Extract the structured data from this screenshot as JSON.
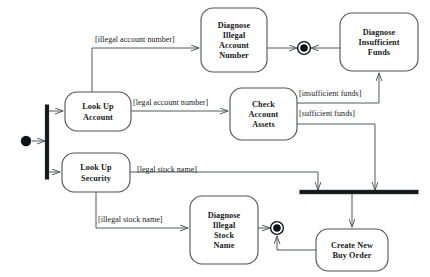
{
  "diagram": {
    "kind": "uml-activity-diagram",
    "title": "",
    "colors": {
      "background": "#ffffff",
      "node_stroke": "#4e5357",
      "edge_stroke": "#555a5e",
      "control_node_fill": "#101214",
      "text": "#17191b"
    },
    "nodes": [
      {
        "id": "initial",
        "type": "initial-node",
        "label": "",
        "cx": 26,
        "cy": 141,
        "r": 5.2
      },
      {
        "id": "fork-main",
        "type": "fork-bar-vertical",
        "label": "",
        "x": 47,
        "y1": 105,
        "y2": 179,
        "thickness": 3.2
      },
      {
        "id": "look-up-account",
        "type": "activity",
        "label": "Look Up\nAccount",
        "lines": [
          "Look Up",
          "Account"
        ],
        "x": 65,
        "y": 92,
        "w": 66,
        "h": 39,
        "rx": 12
      },
      {
        "id": "look-up-security",
        "type": "activity",
        "label": "Look Up\nSecurity",
        "lines": [
          "Look Up",
          "Security"
        ],
        "x": 62,
        "y": 153,
        "w": 68,
        "h": 39,
        "rx": 12
      },
      {
        "id": "diagnose-illegal-account-number",
        "type": "activity",
        "label": "Diagnose Illegal Account Number",
        "lines": [
          "Diagnose",
          "Illegal",
          "Account",
          "Number"
        ],
        "x": 201,
        "y": 8,
        "w": 66,
        "h": 64,
        "rx": 12
      },
      {
        "id": "check-account-assets",
        "type": "activity",
        "label": "Check Account Assets",
        "lines": [
          "Check",
          "Account",
          "Assets"
        ],
        "x": 230,
        "y": 88,
        "w": 67,
        "h": 52,
        "rx": 12
      },
      {
        "id": "diagnose-insufficient-funds",
        "type": "activity",
        "label": "Diagnose Insufficient Funds",
        "lines": [
          "Diagnose",
          "Insufficient",
          "Funds"
        ],
        "x": 340,
        "y": 13,
        "w": 78,
        "h": 58,
        "rx": 12
      },
      {
        "id": "diagnose-illegal-stock-name",
        "type": "activity",
        "label": "Diagnose Illegal Stock Name",
        "lines": [
          "Diagnose",
          "Illegal",
          "Stock",
          "Name"
        ],
        "x": 190,
        "y": 196,
        "w": 68,
        "h": 68,
        "rx": 12
      },
      {
        "id": "create-new-buy-order",
        "type": "activity",
        "label": "Create New Buy Order",
        "lines": [
          "Create New",
          "Buy Order"
        ],
        "x": 316,
        "y": 229,
        "w": 72,
        "h": 42,
        "rx": 12
      },
      {
        "id": "join-bar",
        "type": "join-bar-horizontal",
        "label": "",
        "x1": 300,
        "x2": 418,
        "y": 192,
        "thickness": 3.4
      },
      {
        "id": "final-top",
        "type": "final-node",
        "label": "",
        "cx": 304,
        "cy": 48,
        "r_outer": 6.4,
        "r_inner": 3.8
      },
      {
        "id": "final-bottom",
        "type": "final-node",
        "label": "",
        "cx": 277,
        "cy": 228,
        "r_outer": 6.4,
        "r_inner": 3.8
      }
    ],
    "guards": [
      {
        "id": "guard-illegal-account-number",
        "text": "[illegal account number]",
        "x": 95,
        "y": 42
      },
      {
        "id": "guard-legal-account-number",
        "text": "[legal account number]",
        "x": 133,
        "y": 105
      },
      {
        "id": "guard-insufficient-funds",
        "text": "[insufficient funds]",
        "x": 299,
        "y": 96
      },
      {
        "id": "guard-sufficient-funds",
        "text": "[sufficient funds]",
        "x": 299,
        "y": 116
      },
      {
        "id": "guard-legal-stock-name",
        "text": "[legal stock name]",
        "x": 137,
        "y": 172
      },
      {
        "id": "guard-illegal-stock-name",
        "text": "[illegal stock name]",
        "x": 98,
        "y": 222
      }
    ],
    "edges": [
      {
        "id": "edge-initial-to-fork",
        "from": "initial",
        "to": "fork-main",
        "path": "M 32 141 L 45 141",
        "arrow": true
      },
      {
        "id": "edge-fork-to-look-up-account",
        "from": "fork-main",
        "to": "look-up-account",
        "path": "M 49 111 L 63 111",
        "arrow": true
      },
      {
        "id": "edge-fork-to-look-up-security",
        "from": "fork-main",
        "to": "look-up-security",
        "path": "M 49 172 L 60 172",
        "arrow": true
      },
      {
        "id": "edge-account-to-diagnose-illegal-number",
        "from": "look-up-account",
        "to": "diagnose-illegal-account-number",
        "path": "M 92 92 L 92 48 L 199 48",
        "arrow": true
      },
      {
        "id": "edge-account-to-check-assets",
        "from": "look-up-account",
        "to": "check-account-assets",
        "path": "M 131 111 L 228 111",
        "arrow": true
      },
      {
        "id": "edge-diagnose-number-to-final",
        "from": "diagnose-illegal-account-number",
        "to": "final-top",
        "path": "M 267 48 L 297 48",
        "arrow": true
      },
      {
        "id": "edge-diagnose-funds-to-final",
        "from": "diagnose-insufficient-funds",
        "to": "final-top",
        "path": "M 340 48 L 311 48",
        "arrow": true
      },
      {
        "id": "edge-check-assets-insufficient",
        "from": "check-account-assets",
        "to": "diagnose-insufficient-funds",
        "path": "M 297 103 L 379 103 L 379 73",
        "arrow": true
      },
      {
        "id": "edge-check-assets-sufficient",
        "from": "check-account-assets",
        "to": "join-bar",
        "path": "M 297 124 L 375 124 L 375 190",
        "arrow": true
      },
      {
        "id": "edge-security-to-join",
        "from": "look-up-security",
        "to": "join-bar",
        "path": "M 130 172 L 318 172 L 318 190",
        "arrow": true
      },
      {
        "id": "edge-security-to-diagnose-stock",
        "from": "look-up-security",
        "to": "diagnose-illegal-stock-name",
        "path": "M 96 192 L 96 228 L 188 228",
        "arrow": true
      },
      {
        "id": "edge-diagnose-stock-to-final",
        "from": "diagnose-illegal-stock-name",
        "to": "final-bottom",
        "path": "M 258 228 L 270 228",
        "arrow": true
      },
      {
        "id": "edge-join-to-create-order",
        "from": "join-bar",
        "to": "create-new-buy-order",
        "path": "M 352 194 L 352 227",
        "arrow": true
      },
      {
        "id": "edge-create-order-to-final",
        "from": "create-new-buy-order",
        "to": "final-bottom",
        "path": "M 316 250 L 277 250 L 277 236",
        "arrow": true
      }
    ]
  }
}
